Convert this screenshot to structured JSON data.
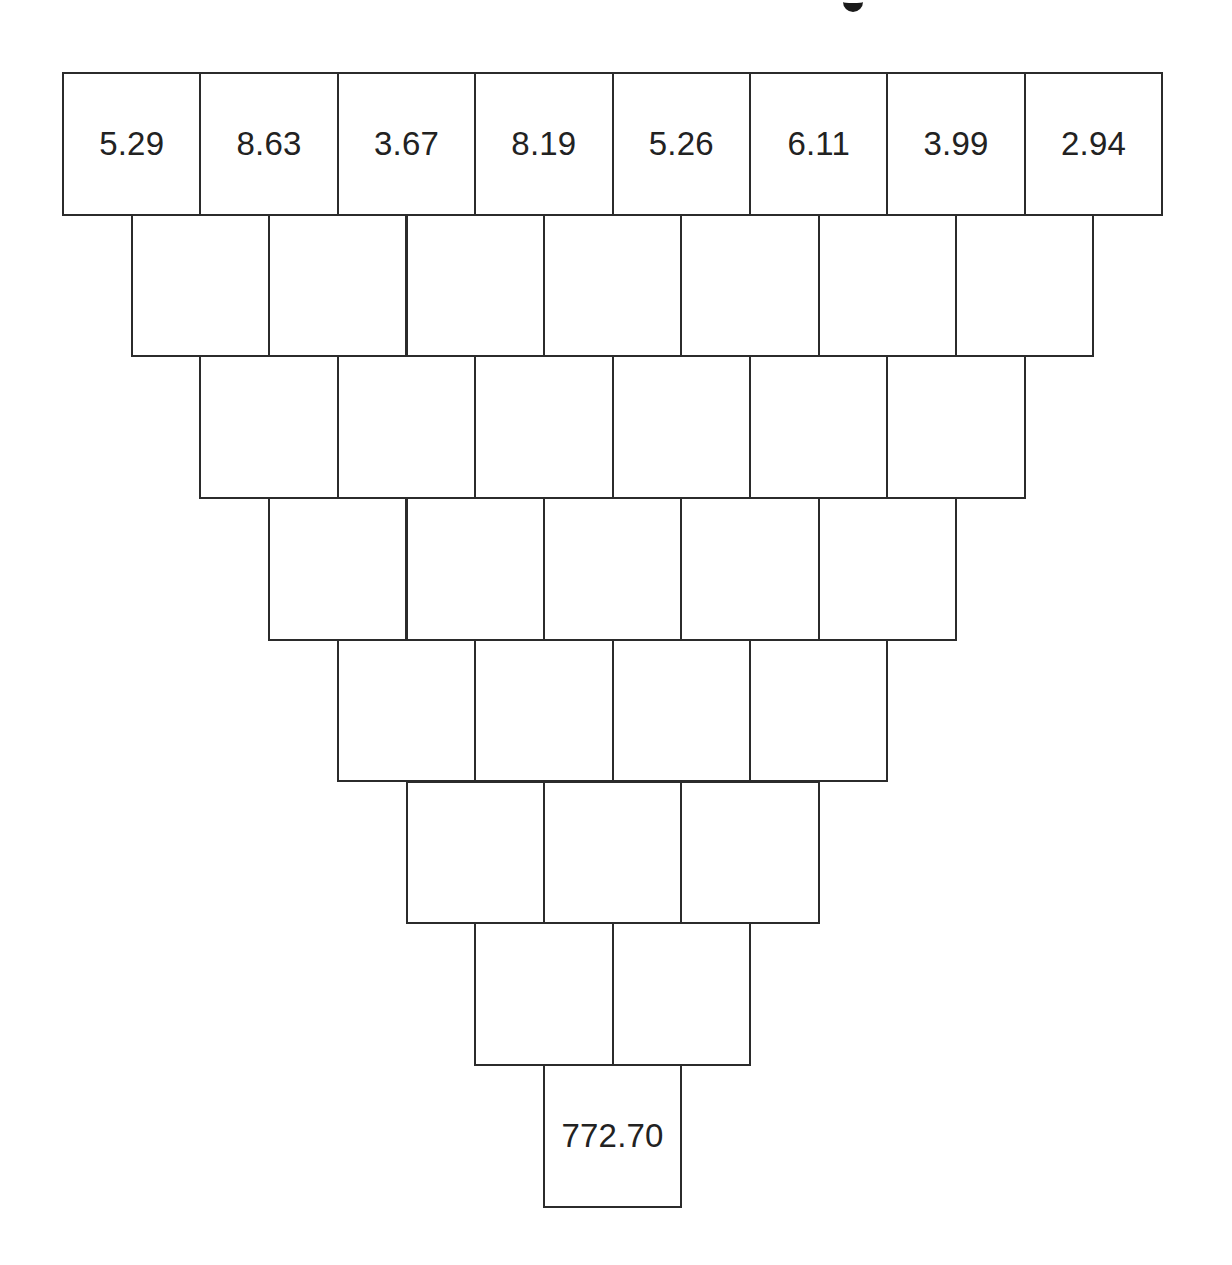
{
  "title": {
    "visible_fragment": "g"
  },
  "pyramid": {
    "colors": {
      "line": "#2b2b2b",
      "text": "#222222",
      "background": "#ffffff"
    },
    "geometry": {
      "origin_x": 62,
      "origin_y": 72,
      "cell_width": 137.4,
      "cell_height": 141.7
    },
    "rows": [
      [
        "5.29",
        "8.63",
        "3.67",
        "8.19",
        "5.26",
        "6.11",
        "3.99",
        "2.94"
      ],
      [
        "",
        "",
        "",
        "",
        "",
        "",
        ""
      ],
      [
        "",
        "",
        "",
        "",
        "",
        ""
      ],
      [
        "",
        "",
        "",
        "",
        ""
      ],
      [
        "",
        "",
        "",
        ""
      ],
      [
        "",
        "",
        ""
      ],
      [
        "",
        ""
      ],
      [
        "772.70"
      ]
    ]
  },
  "chart_data": {
    "type": "table",
    "title": "",
    "top_row": [
      5.29,
      8.63,
      3.67,
      8.19,
      5.26,
      6.11,
      3.99,
      2.94
    ],
    "bottom_value": 772.7,
    "row_lengths": [
      8,
      7,
      6,
      5,
      4,
      3,
      2,
      1
    ]
  }
}
